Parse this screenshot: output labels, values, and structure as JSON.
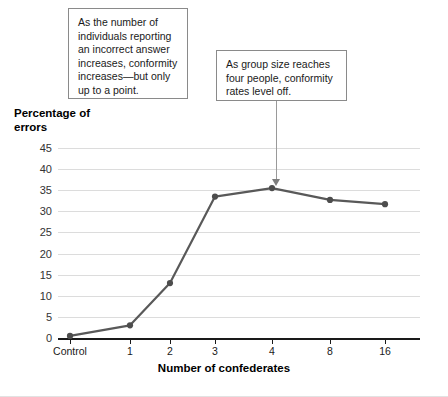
{
  "chart_data": {
    "type": "line",
    "title": "",
    "xlabel": "Number of confederates",
    "ylabel": "Percentage of errors",
    "categories": [
      "Control",
      "1",
      "2",
      "3",
      "4",
      "8",
      "16"
    ],
    "values": [
      0.5,
      3,
      13,
      33.5,
      35.5,
      32.7,
      31.7
    ],
    "series": [
      {
        "name": "Percentage of errors",
        "values": [
          0.5,
          3,
          13,
          33.5,
          35.5,
          32.7,
          31.7
        ]
      }
    ],
    "ylim": [
      0,
      45
    ],
    "yticks": [
      0,
      5,
      10,
      15,
      20,
      25,
      30,
      35,
      40,
      45
    ],
    "ytick_labels": [
      "0",
      "5",
      "10",
      "15",
      "20",
      "25",
      "30",
      "35",
      "40",
      "45"
    ],
    "grid": true,
    "legend": "none",
    "line_color": "#595959",
    "marker_color": "#4d4d4d",
    "gridline_color": "#dcdcdc",
    "axis_color": "#1a1a1a",
    "annotations": [
      {
        "id": "callout-1",
        "text": "As the number of individuals reporting an incorrect answer increases, conformity increases—but only up to a point."
      },
      {
        "id": "callout-2",
        "text": "As group size reaches four people, conformity rates level off.",
        "points_to_category": "4"
      }
    ]
  },
  "axes": {
    "y_title_line1": "Percentage of",
    "y_title_line2": "errors",
    "x_title": "Number of confederates"
  }
}
